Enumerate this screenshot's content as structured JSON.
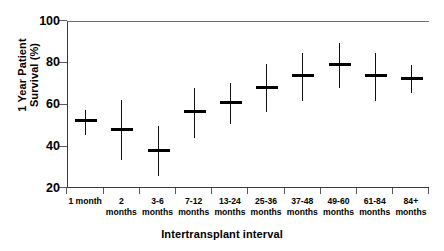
{
  "chart_data": {
    "type": "scatter",
    "title": "",
    "xlabel": "Intertransplant interval",
    "ylabel": "1 Year Patient Survival (%)",
    "ylabel_lines": [
      "1 Year Patient",
      "Survival (%)"
    ],
    "ylim": [
      20,
      100
    ],
    "yticks": [
      20,
      40,
      60,
      80,
      100
    ],
    "ytick_labels": [
      "20",
      "40",
      "60",
      "80",
      "100"
    ],
    "grid": false,
    "legend": "none",
    "categories": [
      "1 month",
      "2 months",
      "3-6 months",
      "7-12 months",
      "13-24 months",
      "25-36 months",
      "37-48 months",
      "49-60 months",
      "61-84 months",
      "84+ months"
    ],
    "category_label_lines": [
      [
        "1 month",
        ""
      ],
      [
        "2",
        "months"
      ],
      [
        "3-6",
        "months"
      ],
      [
        "7-12",
        "months"
      ],
      [
        "13-24",
        "months"
      ],
      [
        "25-36",
        "months"
      ],
      [
        "37-48",
        "months"
      ],
      [
        "49-60",
        "months"
      ],
      [
        "61-84",
        "months"
      ],
      [
        "84+",
        "months"
      ]
    ],
    "series": [
      {
        "name": "1 Year Patient Survival (%)",
        "marker": "cross-with-error-bar",
        "values": [
          52.5,
          48.5,
          38.5,
          57,
          61.5,
          68.5,
          74,
          79.5,
          74,
          73
        ],
        "ci_lower": [
          46,
          34,
          26,
          44.5,
          51,
          57,
          62,
          68.5,
          62,
          66
        ],
        "ci_upper": [
          58,
          62.5,
          50,
          68.5,
          71,
          80,
          85,
          90,
          85,
          79.5
        ]
      }
    ],
    "color": "#000000"
  }
}
